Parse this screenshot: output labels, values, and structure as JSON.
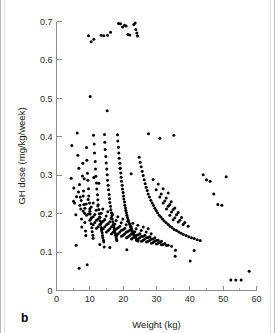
{
  "figure": {
    "panel_label": "b",
    "background_color": "#ffffff",
    "point_color": "#000000",
    "axis_color": "#8d8d8d",
    "border_color": "#b9b9b9"
  },
  "chart_data": {
    "type": "scatter",
    "title": "",
    "subtitle": "",
    "xlabel": "Weight (kg)",
    "ylabel": "GH dose (mg/kg/week)",
    "xlim": [
      0,
      60
    ],
    "ylim": [
      0,
      0.7
    ],
    "xticks": [
      0,
      10,
      20,
      30,
      40,
      50,
      60
    ],
    "xtick_labels": [
      "0",
      "10",
      "20",
      "30",
      "40",
      "50",
      "60"
    ],
    "xminor_ticks": [
      5,
      15,
      25,
      35,
      45,
      55
    ],
    "yticks": [
      0,
      0.1,
      0.2,
      0.3,
      0.4,
      0.5,
      0.6,
      0.7
    ],
    "ytick_labels": [
      "0",
      "0.1",
      "0.2",
      "0.3",
      "0.4",
      "0.5",
      "0.6",
      "0.7"
    ],
    "grid": false,
    "legend": null,
    "legend_position": "none",
    "marker": "circle",
    "marker_size_px": 1.5,
    "annotations": [
      "Separated high-dose cluster near 0.65-0.70 mg/kg/week at weights 9-25 kg",
      "Dense core between 0.12 and 0.40 mg/kg/week at weights 5-30 kg",
      "Hyperbolic arc bands indicate discrete total weekly dose increments",
      "Isolated low outliers near 0.03 mg/kg/week at 7, 10 and 40 kg"
    ],
    "x": [
      9.6,
      10.4,
      11.2,
      13.4,
      14.2,
      15.3,
      16.2,
      18.6,
      19.2,
      19.8,
      20.4,
      20.9,
      21.4,
      22.0,
      23.2,
      23.6,
      23.8,
      24.1,
      24.3,
      10.1,
      15.2,
      4.4,
      5.1,
      5.4,
      5.8,
      6.2,
      6.4,
      6.7,
      6.9,
      7.1,
      7.3,
      7.5,
      7.6,
      7.8,
      7.9,
      8.1,
      8.2,
      8.4,
      8.5,
      8.7,
      8.8,
      9.0,
      9.1,
      9.3,
      9.4,
      9.6,
      9.7,
      9.9,
      10.0,
      10.1,
      10.3,
      10.4,
      10.6,
      10.7,
      10.9,
      11.0,
      11.1,
      11.3,
      11.4,
      11.6,
      11.7,
      11.8,
      12.0,
      12.1,
      12.3,
      12.4,
      12.5,
      12.7,
      12.8,
      13.0,
      13.1,
      13.2,
      13.4,
      13.5,
      13.7,
      13.8,
      13.9,
      14.1,
      14.2,
      14.4,
      14.5,
      14.6,
      14.8,
      14.9,
      15.1,
      15.2,
      15.3,
      15.5,
      15.6,
      15.8,
      15.9,
      16.0,
      16.2,
      16.3,
      16.5,
      16.6,
      16.7,
      16.9,
      17.0,
      17.2,
      17.3,
      17.4,
      17.6,
      17.7,
      17.9,
      18.0,
      18.1,
      18.3,
      18.4,
      18.6,
      18.7,
      18.8,
      19.0,
      19.1,
      19.3,
      19.4,
      19.5,
      19.7,
      19.8,
      20.0,
      20.1,
      20.2,
      20.4,
      20.5,
      20.7,
      20.8,
      21.0,
      21.1,
      21.3,
      21.5,
      21.7,
      21.9,
      22.1,
      22.3,
      22.5,
      22.7,
      22.9,
      23.1,
      23.3,
      23.5,
      23.7,
      23.9,
      24.2,
      24.5,
      24.8,
      25.1,
      25.4,
      25.7,
      26.0,
      26.3,
      26.6,
      26.9,
      27.2,
      27.5,
      27.9,
      28.3,
      28.7,
      29.1,
      29.5,
      29.9,
      30.3,
      30.8,
      31.3,
      31.8,
      32.3,
      32.9,
      33.5,
      34.1,
      34.7,
      35.3,
      36.0,
      36.7,
      37.4,
      38.1,
      38.9,
      39.7,
      40.5,
      41.3,
      42.2,
      43.1,
      44.0,
      45.0,
      46.1,
      47.2,
      48.4,
      49.6,
      50.9,
      52.3,
      53.8,
      55.4,
      57.8,
      6.8,
      9.2,
      40.1,
      35.6,
      35.7,
      41.3,
      16.0,
      21.1,
      14.3,
      11.2,
      27.6,
      31.0,
      35.2,
      4.6,
      5.9,
      13.0,
      19.1,
      22.4,
      8.3,
      12.7,
      5.2,
      6.6,
      8.0,
      9.5,
      11.0,
      12.4,
      13.9,
      15.4,
      16.9,
      18.4,
      19.9,
      21.4,
      22.9,
      24.4,
      26.0,
      27.5,
      29.0,
      30.5,
      32.0,
      33.5,
      6.0,
      7.4,
      8.9,
      10.4,
      11.9,
      13.4,
      14.9,
      16.4,
      17.9,
      19.4,
      20.9,
      22.4,
      23.9,
      25.4,
      26.9,
      28.4,
      29.9,
      31.4,
      32.9,
      34.4,
      7.0,
      8.5,
      10.0,
      11.5,
      13.0,
      14.5,
      16.0,
      17.5,
      19.0,
      20.5,
      22.0,
      23.5,
      25.0,
      26.5,
      28.0,
      29.5,
      31.0,
      32.5,
      34.0,
      35.5,
      8.0,
      9.5,
      11.0,
      12.5,
      14.0,
      15.5,
      17.0,
      18.5,
      20.0,
      21.5,
      23.0,
      24.5,
      26.0,
      27.5,
      29.0,
      30.5,
      32.0,
      33.5,
      35.0,
      36.5,
      9.0,
      10.5,
      12.0,
      13.5,
      15.0,
      16.5,
      18.0,
      19.5,
      21.0,
      22.5,
      24.0,
      25.5,
      27.0,
      28.5,
      30.0,
      31.5,
      33.0,
      34.5,
      36.0,
      37.5,
      10.0,
      11.5,
      13.0,
      14.5,
      16.0,
      17.5,
      19.0,
      20.5,
      22.0,
      23.5,
      25.0,
      26.5,
      28.0,
      29.5,
      31.0,
      32.5,
      34.0,
      35.5,
      37.0,
      38.5,
      11.0,
      12.5,
      14.0,
      15.5,
      17.0,
      18.5,
      20.0,
      21.5,
      23.0,
      24.5,
      26.0,
      27.5,
      29.0,
      30.5,
      32.0,
      33.5,
      35.0,
      36.5,
      38.0,
      39.5,
      12.0,
      13.5,
      15.0,
      16.5,
      18.0,
      19.5,
      21.0,
      22.5,
      24.0,
      25.5,
      27.0,
      28.5,
      30.0,
      31.5,
      33.0,
      34.5,
      36.0,
      37.5,
      39.0,
      40.5
    ],
    "y": [
      0.663,
      0.647,
      0.654,
      0.664,
      0.663,
      0.664,
      0.672,
      0.695,
      0.694,
      0.686,
      0.69,
      0.688,
      0.666,
      0.665,
      0.692,
      0.696,
      0.679,
      0.67,
      0.662,
      0.505,
      0.468,
      0.292,
      0.232,
      0.228,
      0.197,
      0.41,
      0.352,
      0.318,
      0.276,
      0.243,
      0.212,
      0.186,
      0.165,
      0.298,
      0.331,
      0.259,
      0.224,
      0.201,
      0.177,
      0.155,
      0.143,
      0.372,
      0.339,
      0.305,
      0.287,
      0.265,
      0.246,
      0.228,
      0.213,
      0.199,
      0.186,
      0.174,
      0.163,
      0.153,
      0.144,
      0.136,
      0.404,
      0.381,
      0.358,
      0.336,
      0.316,
      0.297,
      0.28,
      0.264,
      0.249,
      0.236,
      0.223,
      0.211,
      0.2,
      0.19,
      0.181,
      0.172,
      0.164,
      0.157,
      0.15,
      0.143,
      0.137,
      0.131,
      0.126,
      0.406,
      0.386,
      0.367,
      0.349,
      0.332,
      0.316,
      0.301,
      0.287,
      0.274,
      0.262,
      0.25,
      0.239,
      0.229,
      0.219,
      0.21,
      0.202,
      0.194,
      0.186,
      0.179,
      0.172,
      0.166,
      0.16,
      0.154,
      0.149,
      0.144,
      0.139,
      0.134,
      0.13,
      0.405,
      0.389,
      0.373,
      0.358,
      0.344,
      0.331,
      0.318,
      0.306,
      0.295,
      0.284,
      0.274,
      0.264,
      0.255,
      0.246,
      0.238,
      0.23,
      0.222,
      0.215,
      0.208,
      0.202,
      0.196,
      0.19,
      0.184,
      0.179,
      0.174,
      0.169,
      0.164,
      0.16,
      0.156,
      0.152,
      0.148,
      0.144,
      0.141,
      0.138,
      0.135,
      0.132,
      0.129,
      0.347,
      0.334,
      0.322,
      0.31,
      0.299,
      0.288,
      0.278,
      0.269,
      0.26,
      0.251,
      0.243,
      0.235,
      0.228,
      0.221,
      0.214,
      0.208,
      0.202,
      0.196,
      0.191,
      0.186,
      0.181,
      0.176,
      0.172,
      0.167,
      0.163,
      0.159,
      0.156,
      0.152,
      0.149,
      0.146,
      0.143,
      0.14,
      0.137,
      0.135,
      0.132,
      0.13,
      0.301,
      0.288,
      0.284,
      0.251,
      0.224,
      0.222,
      0.296,
      0.027,
      0.027,
      0.027,
      0.05,
      0.058,
      0.067,
      0.077,
      0.089,
      0.105,
      0.104,
      0.112,
      0.106,
      0.113,
      0.294,
      0.408,
      0.396,
      0.404,
      0.377,
      0.118,
      0.12,
      0.318,
      0.304,
      0.291,
      0.279,
      0.267,
      0.256,
      0.246,
      0.237,
      0.228,
      0.22,
      0.212,
      0.205,
      0.198,
      0.192,
      0.186,
      0.18,
      0.175,
      0.17,
      0.165,
      0.161,
      0.289,
      0.277,
      0.265,
      0.254,
      0.244,
      0.234,
      0.225,
      0.217,
      0.209,
      0.201,
      0.194,
      0.188,
      0.182,
      0.176,
      0.171,
      0.166,
      0.161,
      0.156,
      0.152,
      0.148,
      0.262,
      0.251,
      0.241,
      0.231,
      0.222,
      0.214,
      0.206,
      0.198,
      0.191,
      0.185,
      0.179,
      0.173,
      0.167,
      0.162,
      0.157,
      0.153,
      0.148,
      0.144,
      0.14,
      0.137,
      0.243,
      0.233,
      0.224,
      0.215,
      0.207,
      0.199,
      0.192,
      0.186,
      0.18,
      0.174,
      0.168,
      0.163,
      0.158,
      0.154,
      0.149,
      0.145,
      0.141,
      0.138,
      0.134,
      0.131,
      0.228,
      0.219,
      0.211,
      0.203,
      0.196,
      0.189,
      0.183,
      0.177,
      0.171,
      0.166,
      0.161,
      0.157,
      0.152,
      0.148,
      0.144,
      0.141,
      0.137,
      0.134,
      0.131,
      0.128,
      0.212,
      0.204,
      0.197,
      0.19,
      0.183,
      0.177,
      0.172,
      0.166,
      0.161,
      0.157,
      0.152,
      0.148,
      0.144,
      0.141,
      0.137,
      0.134,
      0.131,
      0.128,
      0.125,
      0.122,
      0.196,
      0.189,
      0.183,
      0.177,
      0.171,
      0.166,
      0.161,
      0.156,
      0.152,
      0.148,
      0.144,
      0.14,
      0.137,
      0.134,
      0.131,
      0.128,
      0.125,
      0.123,
      0.12,
      0.118,
      0.184,
      0.178,
      0.172,
      0.167,
      0.162,
      0.157,
      0.152,
      0.148,
      0.144,
      0.141,
      0.137,
      0.134,
      0.131,
      0.128,
      0.126,
      0.123,
      0.121,
      0.119,
      0.117,
      0.115
    ]
  }
}
